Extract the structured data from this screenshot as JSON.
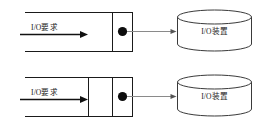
{
  "figure": {
    "background_color": "#ffffff",
    "line_color": "#1a1a1a",
    "dispatch_arrow_color": "#8a8a8a",
    "token_color": "#0d0d0d",
    "cylinder_stroke_color": "#3a3a3a"
  },
  "rows": [
    {
      "id": "upper",
      "request_label": "I/O要求",
      "device_label": "I/O装置",
      "queue_cells": 2,
      "token_count": 1
    },
    {
      "id": "lower",
      "request_label": "I/O要求",
      "device_label": "I/O装置",
      "queue_cells": 3,
      "token_count": 1
    }
  ]
}
